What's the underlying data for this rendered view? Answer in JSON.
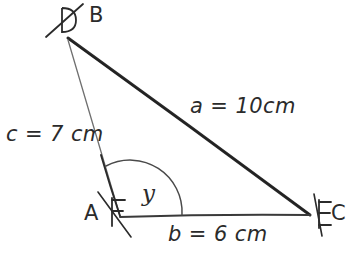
{
  "diagram": {
    "kind": "hand-drawn-triangle",
    "background_color": "#ffffff",
    "ink_color": "#2b2b2b",
    "ink_color_light": "#7a7a7a",
    "vertices": [
      {
        "name": "B",
        "label": "B",
        "x": 68,
        "y": 38
      },
      {
        "name": "A",
        "label": "A",
        "x": 120,
        "y": 216
      },
      {
        "name": "C",
        "label": "C",
        "x": 310,
        "y": 215
      }
    ],
    "sides": [
      {
        "name": "a",
        "label": "a = 10cm",
        "variable": "a",
        "value": 10,
        "unit": "cm",
        "from": "B",
        "to": "C"
      },
      {
        "name": "b",
        "label": "b = 6 cm",
        "variable": "b",
        "value": 6,
        "unit": "cm",
        "from": "A",
        "to": "C"
      },
      {
        "name": "c",
        "label": "c = 7 cm",
        "variable": "c",
        "value": 7,
        "unit": "cm",
        "from": "B",
        "to": "A"
      }
    ],
    "angle": {
      "label": "y",
      "at_vertex": "A",
      "marker": "single-arc"
    },
    "tick_marks": [
      {
        "name": "tick-at-B",
        "strokes": 1,
        "note": "single slash through D-shaped mark near vertex B"
      },
      {
        "name": "tick-at-A",
        "strokes": 1,
        "note": "slash through F-shaped mark near vertex A"
      },
      {
        "name": "tick-at-C",
        "strokes": 1,
        "note": "slash through E-shaped mark near vertex C"
      }
    ]
  },
  "labels": {
    "side_a": "a = 10cm",
    "side_b": "b = 6 cm",
    "side_c": "c = 7 cm",
    "vertex_B": "B",
    "vertex_A": "A",
    "vertex_C": "C",
    "angle_y": "y"
  }
}
